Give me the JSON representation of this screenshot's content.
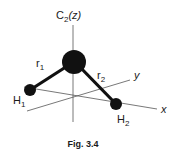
{
  "figure": {
    "caption": "Fig. 3.4",
    "axis_labels": {
      "z_main": "C",
      "z_sub": "2",
      "z_paren": "(z)",
      "x": "x",
      "y": "y"
    },
    "bond_labels": {
      "r1_main": "r",
      "r1_sub": "1",
      "r2_main": "r",
      "r2_sub": "2"
    },
    "atom_labels": {
      "h1_main": "H",
      "h1_sub": "1",
      "h2_main": "H",
      "h2_sub": "2"
    },
    "colors": {
      "atom": "#111111",
      "axis": "#555555",
      "bond": "#111111"
    }
  }
}
